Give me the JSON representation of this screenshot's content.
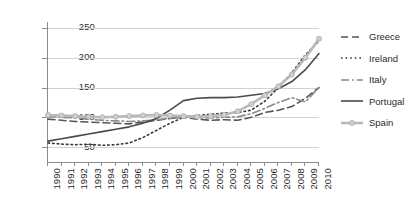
{
  "chart_data": {
    "type": "line",
    "title": "",
    "xlabel": "",
    "ylabel": "",
    "grid": true,
    "legend_position": "right",
    "x": [
      1990,
      1991,
      1992,
      1993,
      1994,
      1995,
      1996,
      1997,
      1998,
      1999,
      2000,
      2001,
      2002,
      2003,
      2004,
      2005,
      2006,
      2007,
      2008,
      2009,
      2010
    ],
    "xlim": [
      1990,
      2010
    ],
    "ylim": [
      25,
      260
    ],
    "yticks": [
      50,
      100,
      150,
      200,
      250
    ],
    "xtick_labels": [
      "1990",
      "1991",
      "1992",
      "1993",
      "1994",
      "1995",
      "1996",
      "1997",
      "1998",
      "1999",
      "2000",
      "2001",
      "2002",
      "2003",
      "2004",
      "2005",
      "2006",
      "2007",
      "2008",
      "2009",
      "2010"
    ],
    "ytick_labels": [
      "250",
      "200",
      "150",
      "100",
      "50"
    ],
    "series": [
      {
        "name": "Greece",
        "style": "dashed",
        "color": "#555555",
        "marker": "none",
        "values": [
          97,
          95,
          93,
          92,
          91,
          90,
          89,
          92,
          95,
          98,
          100,
          97,
          95,
          96,
          95,
          100,
          108,
          112,
          118,
          132,
          150
        ]
      },
      {
        "name": "Ireland",
        "style": "dotted",
        "color": "#3a3a3a",
        "marker": "none",
        "values": [
          57,
          55,
          54,
          55,
          53,
          54,
          57,
          66,
          78,
          90,
          100,
          103,
          105,
          107,
          108,
          112,
          127,
          150,
          175,
          205,
          228
        ]
      },
      {
        "name": "Italy",
        "style": "dash-dot",
        "color": "#8a8a8a",
        "marker": "none",
        "values": [
          101,
          100,
          99,
          97,
          95,
          94,
          93,
          94,
          96,
          98,
          100,
          99,
          99,
          100,
          101,
          106,
          115,
          125,
          133,
          126,
          150
        ]
      },
      {
        "name": "Portugal",
        "style": "solid",
        "color": "#4a4a4a",
        "marker": "none",
        "values": [
          60,
          64,
          68,
          72,
          76,
          80,
          84,
          90,
          98,
          112,
          128,
          132,
          133,
          133,
          134,
          137,
          140,
          148,
          160,
          180,
          207
        ]
      },
      {
        "name": "Spain",
        "style": "solid-marker",
        "color": "#b9b9b9",
        "marker": "circle",
        "values": [
          104,
          103,
          102,
          101,
          100,
          101,
          102,
          103,
          104,
          103,
          102,
          101,
          102,
          104,
          110,
          122,
          137,
          152,
          172,
          200,
          232
        ]
      }
    ]
  },
  "legend": {
    "items": [
      {
        "label": "Greece"
      },
      {
        "label": "Ireland"
      },
      {
        "label": "Italy"
      },
      {
        "label": "Portugal"
      },
      {
        "label": "Spain"
      }
    ]
  }
}
